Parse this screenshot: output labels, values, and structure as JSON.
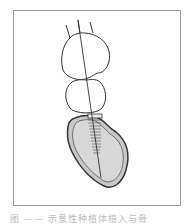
{
  "figure": {
    "caption": "图 —— 示意性种植体植入与骨",
    "illustration": "dental-implant-in-bone-diagram"
  },
  "colors": {
    "line": "#333333",
    "bone": "#c8c8c8",
    "frame": "#999999"
  }
}
